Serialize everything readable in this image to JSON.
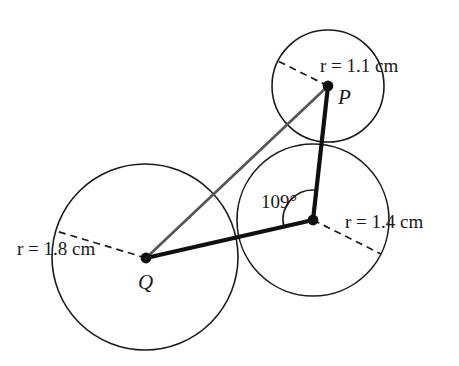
{
  "figure": {
    "background_color": "#ffffff",
    "stroke_color": "#1a1a1a",
    "gray_stroke_color": "#555555"
  },
  "circles": [
    {
      "id": "circle-p",
      "center_label": "P",
      "radius_label_prefix": "r",
      "radius_label_equals": "=",
      "radius_label_value": "1.1",
      "radius_label_unit": "cm",
      "radius_label_full": "r = 1.1 cm",
      "cx": 328,
      "cy": 86,
      "r": 56
    },
    {
      "id": "circle-q",
      "center_label": "Q",
      "radius_label_prefix": "r",
      "radius_label_equals": "=",
      "radius_label_value": "1.8",
      "radius_label_unit": "cm",
      "radius_label_full": "r = 1.8 cm",
      "cx": 145,
      "cy": 257,
      "r": 93
    },
    {
      "id": "circle-r",
      "center_label": "",
      "radius_label_prefix": "r",
      "radius_label_equals": "=",
      "radius_label_value": "1.4",
      "radius_label_unit": "cm",
      "radius_label_full": "r = 1.4 cm",
      "cx": 313,
      "cy": 220,
      "r": 76
    }
  ],
  "labels": {
    "point_p": "P",
    "point_q": "Q",
    "radius_p": "r = 1.1 cm",
    "radius_q": "r = 1.8 cm",
    "radius_r": "r = 1.4 cm",
    "angle": "109°",
    "angle_value": "109",
    "degree_symbol": "°"
  },
  "triangle": {
    "vertices": [
      {
        "name": "P",
        "x": 328,
        "y": 86
      },
      {
        "name": "Q",
        "x": 146,
        "y": 258
      },
      {
        "name": "R",
        "x": 313,
        "y": 220
      }
    ],
    "edges": [
      {
        "from": "P",
        "to": "Q",
        "style": "gray",
        "width": 2.6
      },
      {
        "from": "Q",
        "to": "R",
        "style": "black",
        "width": 4.2
      },
      {
        "from": "R",
        "to": "P",
        "style": "black",
        "width": 4.2
      }
    ]
  },
  "angle_marker": {
    "at_vertex": "R",
    "value": 109,
    "arc_radius": 30,
    "label": "109°"
  },
  "dashed_radii": [
    {
      "circle": "circle-p",
      "from_x": 328,
      "from_y": 86,
      "to_x": 278,
      "to_y": 61
    },
    {
      "circle": "circle-q",
      "from_x": 146,
      "from_y": 258,
      "to_x": 56,
      "to_y": 231
    },
    {
      "circle": "circle-r",
      "from_x": 313,
      "from_y": 220,
      "to_x": 381,
      "to_y": 254
    }
  ],
  "chart_data": {
    "type": "diagram",
    "subtype": "geometric-construction",
    "elements": [
      {
        "kind": "circle",
        "label": "P",
        "radius_cm": 1.1,
        "pixel_cx": 328,
        "pixel_cy": 86,
        "pixel_r": 56
      },
      {
        "kind": "circle",
        "label": "Q",
        "radius_cm": 1.8,
        "pixel_cx": 145,
        "pixel_cy": 257,
        "pixel_r": 93
      },
      {
        "kind": "circle",
        "label": "R",
        "radius_cm": 1.4,
        "pixel_cx": 313,
        "pixel_cy": 220,
        "pixel_r": 76
      },
      {
        "kind": "angle",
        "vertex": "R",
        "degrees": 109
      }
    ],
    "title": "",
    "xlabel": "",
    "ylabel": ""
  }
}
